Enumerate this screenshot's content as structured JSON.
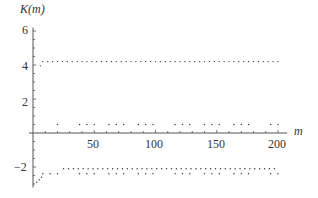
{
  "chart_data": {
    "type": "scatter",
    "title": "",
    "xlabel": "m",
    "ylabel": "K(m)",
    "xlim": [
      0,
      205
    ],
    "ylim": [
      -3.2,
      6.2
    ],
    "x_ticks": [
      50,
      100,
      150,
      200
    ],
    "y_ticks": [
      -2,
      2,
      4,
      6
    ],
    "x_tick_labels": [
      "50",
      "100",
      "150",
      "200"
    ],
    "y_tick_labels": [
      "−2",
      "2",
      "4",
      "6"
    ],
    "grid": false,
    "legend": null,
    "series": [
      {
        "name": "upper branch",
        "approx_value": 4.2,
        "x_range": [
          8,
          200
        ],
        "start_point": {
          "x": 6,
          "y": 3.95
        }
      },
      {
        "name": "middle branch",
        "approx_value": 0.5,
        "x_range": [
          20,
          200
        ],
        "sparse": true
      },
      {
        "name": "lower branch A",
        "approx_value": -2.1,
        "x_range": [
          25,
          200
        ]
      },
      {
        "name": "lower branch B",
        "approx_value": -2.4,
        "x_range": [
          8,
          200
        ],
        "sparse": true
      },
      {
        "name": "initial points",
        "points": [
          {
            "x": 3,
            "y": -2.9
          },
          {
            "x": 5,
            "y": -2.75
          },
          {
            "x": 7,
            "y": -2.6
          }
        ]
      }
    ]
  }
}
